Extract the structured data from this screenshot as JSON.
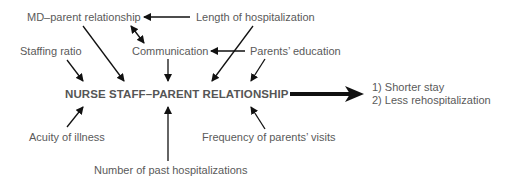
{
  "diagram": {
    "center_node": "NURSE STAFF–PARENT RELATIONSHIP",
    "factors": {
      "md_parent_relationship": "MD–parent relationship",
      "length_of_hospitalization": "Length of hospitalization",
      "staffing_ratio": "Staffing ratio",
      "communication": "Communication",
      "parents_education": "Parents’ education",
      "acuity_of_illness": "Acuity of illness",
      "frequency_of_visits": "Frequency of parents’ visits",
      "past_hospitalizations": "Number of past hospitalizations"
    },
    "outcomes": [
      "1) Shorter stay",
      "2) Less rehospitalization"
    ],
    "colors": {
      "text": "#5a5a5a",
      "arrow": "#111111"
    }
  }
}
